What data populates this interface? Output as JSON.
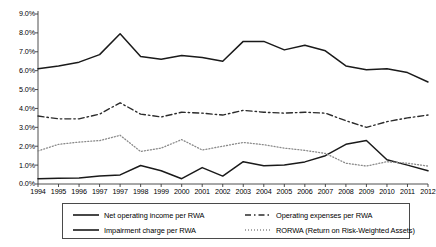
{
  "chart_data": {
    "type": "line",
    "title": "",
    "xlabel": "",
    "ylabel": "",
    "ylim": [
      0,
      9
    ],
    "ytick_labels": [
      "0.0%",
      "1.0%",
      "2.0%",
      "3.0%",
      "4.0%",
      "5.0%",
      "6.0%",
      "7.0%",
      "8.0%",
      "9.0%"
    ],
    "ytick_values": [
      0,
      1,
      2,
      3,
      4,
      5,
      6,
      7,
      8,
      9
    ],
    "grid": false,
    "legend_position": "bottom",
    "categories": [
      "1994",
      "1995",
      "1996",
      "1997",
      "1997",
      "1998",
      "1999",
      "2000",
      "2001",
      "2002",
      "2003",
      "2004",
      "2005",
      "2006",
      "2007",
      "2008",
      "2009",
      "2010",
      "2011",
      "2012"
    ],
    "series": [
      {
        "name": "Net operating income per RWA",
        "style": "solid",
        "color": "#1a1a1a",
        "values": [
          6.1,
          6.25,
          6.45,
          6.85,
          7.95,
          6.75,
          6.6,
          6.8,
          6.7,
          6.5,
          7.55,
          7.55,
          7.1,
          7.35,
          7.05,
          6.25,
          6.05,
          6.1,
          5.9,
          5.4
        ]
      },
      {
        "name": "Operating expenses per RWA",
        "style": "dashed",
        "color": "#2b2b2b",
        "values": [
          3.6,
          3.45,
          3.45,
          3.7,
          4.3,
          3.7,
          3.55,
          3.8,
          3.75,
          3.65,
          3.9,
          3.8,
          3.75,
          3.8,
          3.75,
          3.35,
          3.0,
          3.3,
          3.5,
          3.65
        ]
      },
      {
        "name": "Impairment charge per RWA",
        "style": "solid",
        "color": "#1a1a1a",
        "values": [
          0.28,
          0.3,
          0.32,
          0.42,
          0.48,
          0.98,
          0.7,
          0.28,
          0.87,
          0.42,
          1.18,
          0.97,
          1.0,
          1.17,
          1.5,
          2.1,
          2.3,
          1.28,
          1.0,
          0.7
        ]
      },
      {
        "name": "RORWA (Return on Risk-Weighted Assets)",
        "style": "dotted",
        "color": "#8a8a8a",
        "values": [
          1.75,
          2.1,
          2.22,
          2.3,
          2.58,
          1.72,
          1.9,
          2.35,
          1.8,
          2.0,
          2.2,
          2.08,
          1.9,
          1.78,
          1.62,
          1.1,
          0.95,
          1.18,
          1.1,
          0.95
        ]
      }
    ]
  },
  "legend": {
    "items": [
      {
        "label": "Net operating income per RWA"
      },
      {
        "label": "Operating expenses per RWA"
      },
      {
        "label": "Impairment charge per RWA"
      },
      {
        "label": "RORWA (Return on Risk-Weighted Assets)"
      }
    ]
  }
}
